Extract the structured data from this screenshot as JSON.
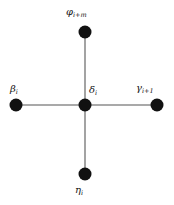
{
  "figure": {
    "type": "node-link-diagram",
    "background_color": "#ffffff",
    "edge_color": "#8c8c8c",
    "node_color": "#111111",
    "label_color": "#141414",
    "canvas": {
      "width": 174,
      "height": 205
    }
  },
  "nodes": [
    {
      "id": "phi",
      "position": "top",
      "x": 85,
      "y": 32,
      "radius": 6.5,
      "label_symbol": "φ",
      "label_subscript": "i+m",
      "label_text": "φi+m"
    },
    {
      "id": "beta",
      "position": "left",
      "x": 16,
      "y": 105,
      "radius": 6.5,
      "label_symbol": "β",
      "label_subscript": "i",
      "label_text": "βi"
    },
    {
      "id": "delta",
      "position": "center",
      "x": 85,
      "y": 105,
      "radius": 6.5,
      "label_symbol": "δ",
      "label_subscript": "i",
      "label_text": "δi"
    },
    {
      "id": "gamma",
      "position": "right",
      "x": 157,
      "y": 105,
      "radius": 6.5,
      "label_symbol": "γ",
      "label_subscript": "i+1",
      "label_text": "γi+1"
    },
    {
      "id": "eta",
      "position": "bottom",
      "x": 85,
      "y": 174,
      "radius": 6.5,
      "label_symbol": "η",
      "label_subscript": "i",
      "label_text": "ηi"
    }
  ],
  "edges": [
    {
      "id": "edge-delta-phi",
      "from": "delta",
      "to": "phi",
      "x1": 85,
      "y1": 105,
      "x2": 85,
      "y2": 32
    },
    {
      "id": "edge-delta-eta",
      "from": "delta",
      "to": "eta",
      "x1": 85,
      "y1": 105,
      "x2": 85,
      "y2": 174
    },
    {
      "id": "edge-delta-beta",
      "from": "delta",
      "to": "beta",
      "x1": 85,
      "y1": 105,
      "x2": 16,
      "y2": 105
    },
    {
      "id": "edge-delta-gamma",
      "from": "delta",
      "to": "gamma",
      "x1": 85,
      "y1": 105,
      "x2": 157,
      "y2": 105
    }
  ]
}
